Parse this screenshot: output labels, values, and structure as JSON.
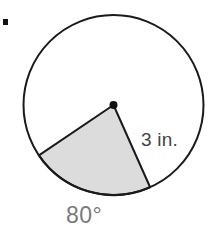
{
  "figure": {
    "bullet_marker": "■",
    "background_color": "#ffffff",
    "labels": {
      "radius": "3 in.",
      "angle": "80°"
    }
  },
  "chart_data": {
    "type": "pie",
    "title": "",
    "subtitle": "",
    "xlabel": "",
    "ylabel": "",
    "grid": false,
    "legend": "none",
    "shape": "circle-with-shaded-sector",
    "circle": {
      "center_x": 113.5,
      "center_y": 105,
      "radius_px": 90,
      "radius_label": "3 in.",
      "radius_value": 3,
      "radius_units": "in.",
      "stroke_color": "#1a1a1a",
      "stroke_width": 2,
      "fill_color": "#ffffff"
    },
    "center_point": {
      "x": 113.5,
      "y": 105,
      "radius_px": 4,
      "color": "#111111"
    },
    "sector": {
      "label": "80°",
      "angle_degrees": 80,
      "start_angle_degrees": 214,
      "end_angle_degrees": 294,
      "fill_color": "#dcdcdc",
      "stroke_color": "#1a1a1a",
      "stroke_width": 2,
      "fraction_of_circle": 0.2222
    },
    "categories": [
      "shaded sector",
      "remaining circle"
    ],
    "values": [
      80,
      280
    ],
    "annotations": [
      {
        "text": "3 in.",
        "x": 141,
        "y": 130,
        "role": "radius-measure",
        "color": "#434343"
      },
      {
        "text": "80°",
        "x": 66,
        "y": 204,
        "role": "central-angle-measure",
        "color": "#7a7a7a"
      }
    ]
  }
}
